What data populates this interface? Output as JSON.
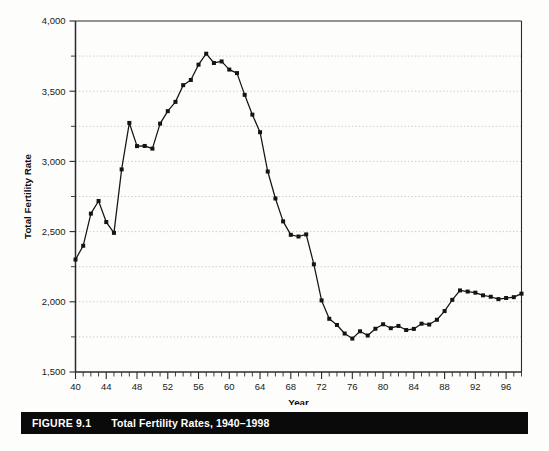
{
  "figure": {
    "caption_number": "FIGURE 9.1",
    "caption_title": "Total Fertility Rates, 1940–1998"
  },
  "chart_data": {
    "type": "line",
    "title": "Total Fertility Rates, 1940–1998",
    "xlabel": "Year",
    "ylabel": "Total Fertility Rate",
    "xlim": [
      40,
      98
    ],
    "ylim": [
      1500,
      4000
    ],
    "y_major_ticks": [
      1500,
      2000,
      2500,
      3000,
      3500,
      4000
    ],
    "y_tick_labels": [
      "1,500",
      "2,000",
      "2,500",
      "3,000",
      "3,500",
      "4,000"
    ],
    "y_minor_gridlines": [
      1750,
      2250,
      2750,
      3250,
      3750
    ],
    "x_major_ticks": [
      40,
      44,
      48,
      52,
      56,
      60,
      64,
      68,
      72,
      76,
      80,
      84,
      88,
      92,
      96
    ],
    "x_tick_labels": [
      "40",
      "44",
      "48",
      "52",
      "56",
      "60",
      "64",
      "68",
      "72",
      "76",
      "80",
      "84",
      "88",
      "92",
      "96"
    ],
    "x_minor_tick_step": 1,
    "grid": true,
    "legend": "none",
    "marker": "square",
    "line_color": "#141414",
    "marker_color": "#141414",
    "grid_color": "#b9b9b9",
    "x": [
      40,
      41,
      42,
      43,
      44,
      45,
      46,
      47,
      48,
      49,
      50,
      51,
      52,
      53,
      54,
      55,
      56,
      57,
      58,
      59,
      60,
      61,
      62,
      63,
      64,
      65,
      66,
      67,
      68,
      69,
      70,
      71,
      72,
      73,
      74,
      75,
      76,
      77,
      78,
      79,
      80,
      81,
      82,
      83,
      84,
      85,
      86,
      87,
      88,
      89,
      90,
      91,
      92,
      93,
      94,
      95,
      96,
      97,
      98
    ],
    "values": [
      2301,
      2399,
      2628,
      2718,
      2568,
      2491,
      2943,
      3274,
      3109,
      3110,
      3091,
      3269,
      3358,
      3424,
      3543,
      3580,
      3689,
      3767,
      3701,
      3712,
      3654,
      3629,
      3474,
      3333,
      3208,
      2928,
      2736,
      2573,
      2477,
      2465,
      2480,
      2267,
      2010,
      1879,
      1835,
      1774,
      1738,
      1790,
      1760,
      1808,
      1840,
      1812,
      1828,
      1799,
      1807,
      1844,
      1838,
      1872,
      1934,
      2014,
      2081,
      2073,
      2065,
      2046,
      2036,
      2019,
      2027,
      2033,
      2058
    ]
  }
}
